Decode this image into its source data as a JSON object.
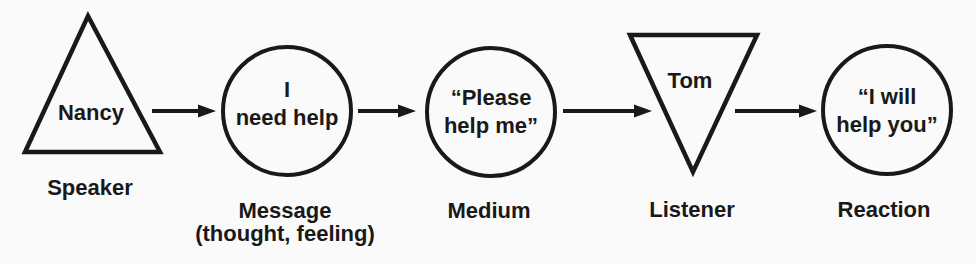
{
  "figure": {
    "background_color": "#fafafa",
    "ink_color": "#191919"
  },
  "nodes": {
    "speaker": {
      "shape": "triangle-up",
      "shape_text": "Nancy",
      "label": "Speaker"
    },
    "message": {
      "shape": "circle",
      "line1": "I",
      "line2": "need help",
      "label_line1": "Message",
      "label_line2": "(thought, feeling)"
    },
    "medium": {
      "shape": "circle",
      "line1": "“Please",
      "line2": "help me”",
      "label": "Medium"
    },
    "listener": {
      "shape": "triangle-down",
      "shape_text": "Tom",
      "label": "Listener"
    },
    "reaction": {
      "shape": "circle",
      "line1": "“I will",
      "line2": "help you”",
      "label": "Reaction"
    }
  },
  "flow": [
    "Speaker",
    "Message",
    "Medium",
    "Listener",
    "Reaction"
  ]
}
